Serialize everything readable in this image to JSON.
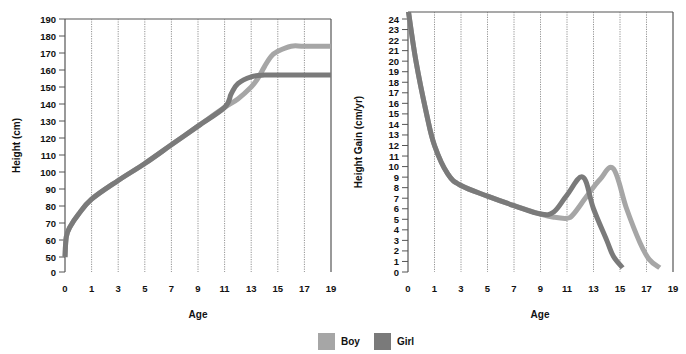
{
  "legend": {
    "items": [
      {
        "label": "Boy",
        "color": "#a6a6a6"
      },
      {
        "label": "Girl",
        "color": "#7a7a7a"
      }
    ]
  },
  "chart_data": [
    {
      "type": "line",
      "title": "",
      "xlabel": "Age",
      "ylabel": "Height (cm)",
      "x_ticks": [
        "0",
        "1",
        "3",
        "5",
        "7",
        "9",
        "11",
        "13",
        "15",
        "17",
        "19"
      ],
      "y_ticks": [
        "0",
        "50",
        "60",
        "70",
        "80",
        "90",
        "100",
        "110",
        "120",
        "130",
        "140",
        "150",
        "160",
        "170",
        "180",
        "190"
      ],
      "ylim": [
        0,
        190
      ],
      "grid": "vertical dotted",
      "legend_position": "bottom center",
      "series": [
        {
          "name": "Boy",
          "color": "#a6a6a6",
          "points": [
            [
              0,
              50
            ],
            [
              0.05,
              62
            ],
            [
              0.2,
              68
            ],
            [
              0.5,
              75
            ],
            [
              1,
              84
            ],
            [
              3,
              95
            ],
            [
              5,
              105
            ],
            [
              7,
              116
            ],
            [
              9,
              127
            ],
            [
              11,
              138
            ],
            [
              12,
              143
            ],
            [
              13,
              150
            ],
            [
              13.5,
              155
            ],
            [
              14,
              162
            ],
            [
              14.5,
              168
            ],
            [
              15,
              171
            ],
            [
              16,
              174
            ],
            [
              17,
              174
            ],
            [
              19,
              174
            ]
          ]
        },
        {
          "name": "Girl",
          "color": "#7a7a7a",
          "points": [
            [
              0,
              50
            ],
            [
              0.05,
              62
            ],
            [
              0.2,
              68
            ],
            [
              0.5,
              75
            ],
            [
              1,
              84
            ],
            [
              3,
              95
            ],
            [
              5,
              105
            ],
            [
              7,
              116
            ],
            [
              9,
              127
            ],
            [
              11,
              138
            ],
            [
              11.5,
              146
            ],
            [
              12,
              152
            ],
            [
              13,
              156
            ],
            [
              14,
              157
            ],
            [
              15,
              157
            ],
            [
              17,
              157
            ],
            [
              19,
              157
            ]
          ]
        }
      ]
    },
    {
      "type": "line",
      "title": "",
      "xlabel": "Age",
      "ylabel": "Height Gain (cm/yr)",
      "x_ticks": [
        "0",
        "1",
        "3",
        "5",
        "7",
        "9",
        "11",
        "13",
        "15",
        "17",
        "19"
      ],
      "y_ticks": [
        "0",
        "1",
        "2",
        "3",
        "4",
        "5",
        "6",
        "7",
        "8",
        "9",
        "10",
        "11",
        "12",
        "13",
        "14",
        "15",
        "16",
        "17",
        "18",
        "19",
        "20",
        "21",
        "22",
        "23",
        "24"
      ],
      "ylim": [
        0,
        24
      ],
      "grid": "vertical dotted",
      "legend_position": "bottom center",
      "series": [
        {
          "name": "Boy",
          "color": "#a6a6a6",
          "points": [
            [
              0,
              25
            ],
            [
              0.3,
              20
            ],
            [
              0.7,
              15
            ],
            [
              1,
              12
            ],
            [
              2,
              9.3
            ],
            [
              3,
              8.2
            ],
            [
              5,
              7.2
            ],
            [
              7,
              6.3
            ],
            [
              9,
              5.5
            ],
            [
              10,
              5.2
            ],
            [
              11,
              5.1
            ],
            [
              11.5,
              5.5
            ],
            [
              12.5,
              7.2
            ],
            [
              13.5,
              8.8
            ],
            [
              14.5,
              9.8
            ],
            [
              15.5,
              6
            ],
            [
              16.5,
              2.8
            ],
            [
              17.2,
              1.2
            ],
            [
              18,
              0.4
            ]
          ]
        },
        {
          "name": "Girl",
          "color": "#7a7a7a",
          "points": [
            [
              0,
              25
            ],
            [
              0.3,
              20
            ],
            [
              0.7,
              15
            ],
            [
              1,
              12
            ],
            [
              2,
              9.3
            ],
            [
              3,
              8.2
            ],
            [
              5,
              7.2
            ],
            [
              7,
              6.3
            ],
            [
              9,
              5.5
            ],
            [
              10,
              5.7
            ],
            [
              11,
              7.3
            ],
            [
              12.2,
              9
            ],
            [
              13,
              6
            ],
            [
              14,
              3
            ],
            [
              14.5,
              1.5
            ],
            [
              15.2,
              0.4
            ]
          ]
        }
      ]
    }
  ]
}
